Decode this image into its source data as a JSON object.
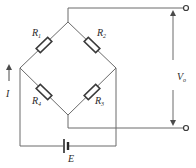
{
  "diagram": {
    "resistors": [
      {
        "id": "R1",
        "label": "R",
        "sub": "1"
      },
      {
        "id": "R2",
        "label": "R",
        "sub": "2"
      },
      {
        "id": "R3",
        "label": "R",
        "sub": "3"
      },
      {
        "id": "R4",
        "label": "R",
        "sub": "4"
      }
    ],
    "source": {
      "label": "E"
    },
    "current": {
      "label": "I"
    },
    "output": {
      "label": "V",
      "sub": "o"
    },
    "colors": {
      "wire": "#6a6a6a",
      "component": "#3a3a3a",
      "background": "#ffffff"
    }
  }
}
